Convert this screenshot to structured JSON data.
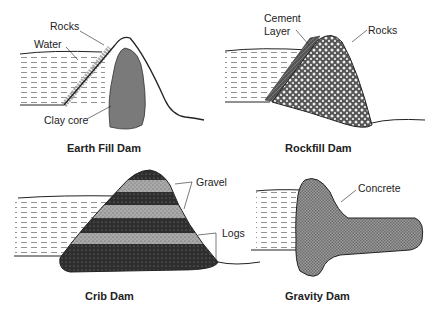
{
  "panels": [
    {
      "title": "Earth Fill Dam",
      "labels": [
        "Rocks",
        "Water",
        "Clay core"
      ]
    },
    {
      "title": "Rockfill Dam",
      "labels": [
        "Cement",
        "Layer",
        "Rocks"
      ]
    },
    {
      "title": "Crib Dam",
      "labels": [
        "Gravel",
        "Logs"
      ]
    },
    {
      "title": "Gravity Dam",
      "labels": [
        "Concrete"
      ]
    }
  ],
  "colors": {
    "line": "#222222",
    "clay_core": "#7a7a7a",
    "concrete": "#8a8a8a",
    "cement": "#5a5a5a",
    "log_band": "#2e2e2e",
    "gravel_band": "#a8a8a8"
  }
}
